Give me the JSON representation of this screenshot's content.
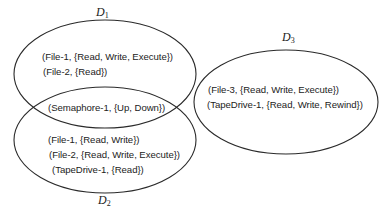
{
  "diagram": {
    "type": "protection-domains",
    "domains": [
      {
        "id": "D1",
        "label": "D",
        "subscript": "1",
        "entries": [
          "(File-1, {Read, Write, Execute})",
          "(File-2, {Read})"
        ]
      },
      {
        "id": "D2",
        "label": "D",
        "subscript": "2",
        "entries": [
          "(File-1, {Read, Write})",
          "(File-2, {Read, Write, Execute})",
          "(TapeDrive-1, {Read})"
        ]
      },
      {
        "id": "D3",
        "label": "D",
        "subscript": "3",
        "entries": [
          "(File-3, {Read, Write, Execute})",
          "(TapeDrive-1, {Read, Write, Rewind})"
        ]
      }
    ],
    "shared": {
      "domains": [
        "D1",
        "D2"
      ],
      "entry": "(Semaphore-1, {Up, Down})"
    },
    "colors": {
      "stroke": "#2a2a2a",
      "text": "#222222",
      "background": "#ffffff"
    }
  }
}
